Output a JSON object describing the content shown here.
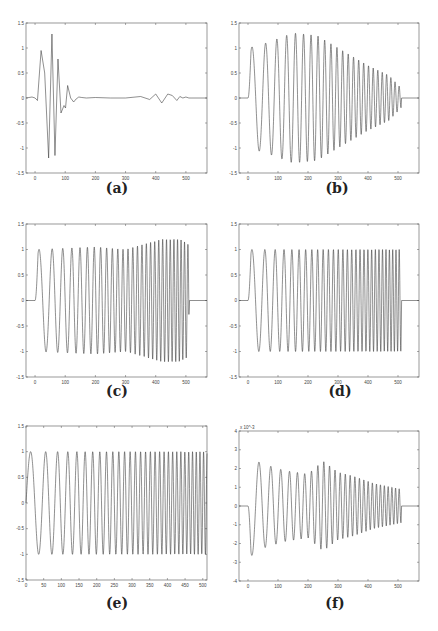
{
  "chart_data": [
    {
      "id": "a",
      "caption": "(a)",
      "type": "line",
      "box": {
        "left": 26,
        "top": 23,
        "right": 207,
        "bottom": 173
      },
      "xlim": [
        -30,
        570
      ],
      "ylim": [
        -1.5,
        1.5
      ],
      "xticks": [
        0,
        100,
        200,
        300,
        400,
        500
      ],
      "yticks": [
        -1.5,
        -1,
        -0.5,
        0,
        0.5,
        1,
        1.5
      ],
      "ytick_labels": [
        "-1.5",
        "-1",
        "-0.5",
        "0",
        "0.5",
        "1",
        "1.5"
      ],
      "x": [
        -30,
        -10,
        0,
        8,
        20,
        32,
        45,
        56,
        66,
        76,
        86,
        96,
        101,
        108,
        118,
        128,
        136,
        145,
        155,
        170,
        200,
        250,
        300,
        350,
        380,
        400,
        420,
        440,
        455,
        470,
        480,
        490,
        500,
        510,
        520,
        570
      ],
      "y": [
        0,
        0.02,
        0,
        -0.05,
        0.95,
        0.5,
        -1.2,
        1.28,
        -1.15,
        0.78,
        -0.3,
        -0.15,
        -0.2,
        0.25,
        0,
        -0.08,
        -0.02,
        0.02,
        0.01,
        0,
        0.01,
        0,
        0,
        0.03,
        -0.03,
        0.08,
        -0.1,
        0.08,
        0.05,
        -0.05,
        0.03,
        0,
        0.02,
        0,
        0,
        0
      ]
    },
    {
      "id": "b",
      "caption": "(b)",
      "type": "line",
      "box": {
        "left": 239,
        "top": 23,
        "right": 419,
        "bottom": 173
      },
      "xlim": [
        -30,
        570
      ],
      "ylim": [
        -1.5,
        1.5
      ],
      "xticks": [
        0,
        100,
        200,
        300,
        400,
        500
      ],
      "yticks": [
        -1.5,
        -1,
        -0.5,
        0,
        0.5,
        1,
        1.5
      ],
      "ytick_labels": [
        "-1.5",
        "-1",
        "-0.5",
        "0",
        "0.5",
        "1",
        "1.5"
      ],
      "signal": {
        "kind": "chirp",
        "start": 0,
        "end": 510,
        "f0": 0.018,
        "f1": 0.075,
        "amp_env": [
          [
            0,
            1.0
          ],
          [
            60,
            1.1
          ],
          [
            150,
            1.3
          ],
          [
            230,
            1.25
          ],
          [
            300,
            1.0
          ],
          [
            400,
            0.65
          ],
          [
            470,
            0.45
          ],
          [
            510,
            0.2
          ]
        ]
      }
    },
    {
      "id": "c",
      "caption": "(c)",
      "type": "line",
      "box": {
        "left": 26,
        "top": 224,
        "right": 207,
        "bottom": 377
      },
      "xlim": [
        -30,
        570
      ],
      "ylim": [
        -1.5,
        1.5
      ],
      "xticks": [
        0,
        100,
        200,
        300,
        400,
        500
      ],
      "yticks": [
        -1.5,
        -1,
        -0.5,
        0,
        0.5,
        1,
        1.5
      ],
      "ytick_labels": [
        "-1.5",
        "-1",
        "-0.5",
        "0",
        "0.5",
        "1",
        "1.5"
      ],
      "signal": {
        "kind": "chirp",
        "start": 0,
        "end": 510,
        "f0": 0.018,
        "f1": 0.09,
        "amp_env": [
          [
            0,
            1.0
          ],
          [
            200,
            1.05
          ],
          [
            300,
            1.0
          ],
          [
            420,
            1.2
          ],
          [
            480,
            1.2
          ],
          [
            510,
            1.1
          ]
        ]
      }
    },
    {
      "id": "d",
      "caption": "(d)",
      "type": "line",
      "box": {
        "left": 239,
        "top": 224,
        "right": 419,
        "bottom": 377
      },
      "xlim": [
        -30,
        570
      ],
      "ylim": [
        -1.5,
        1.5
      ],
      "xticks": [
        0,
        100,
        200,
        300,
        400,
        500
      ],
      "yticks": [
        -1.5,
        -1,
        -0.5,
        0,
        0.5,
        1,
        1.5
      ],
      "ytick_labels": [
        "-1.5",
        "-1",
        "-0.5",
        "0",
        "0.5",
        "1",
        "1.5"
      ],
      "signal": {
        "kind": "chirp",
        "start": 0,
        "end": 510,
        "f0": 0.018,
        "f1": 0.095,
        "amp_env": [
          [
            0,
            1.0
          ],
          [
            510,
            1.0
          ]
        ]
      }
    },
    {
      "id": "e",
      "caption": "(e)",
      "type": "line",
      "box": {
        "left": 26,
        "top": 426,
        "right": 207,
        "bottom": 580
      },
      "xlim": [
        0,
        512
      ],
      "ylim": [
        -1.5,
        1.5
      ],
      "xticks": [
        0,
        50,
        100,
        150,
        200,
        250,
        300,
        350,
        400,
        450,
        500
      ],
      "yticks": [
        -1.5,
        -1,
        -0.5,
        0,
        0.5,
        1,
        1.5
      ],
      "ytick_labels": [
        "-1.5",
        "-1",
        "-0.5",
        "0",
        "0.5",
        "1",
        "1.5"
      ],
      "signal": {
        "kind": "chirp",
        "start": 0,
        "end": 512,
        "f0": 0.018,
        "f1": 0.1,
        "amp_env": [
          [
            0,
            1.0
          ],
          [
            512,
            1.0
          ]
        ],
        "phase_start": "sin"
      }
    },
    {
      "id": "f",
      "caption": "(f)",
      "type": "line",
      "box": {
        "left": 239,
        "top": 431,
        "right": 419,
        "bottom": 581
      },
      "xlim": [
        -30,
        570
      ],
      "ylim": [
        -4,
        4
      ],
      "y_exponent": "x 10^-3",
      "xticks": [
        0,
        100,
        200,
        300,
        400,
        500
      ],
      "yticks": [
        -4,
        -3,
        -2,
        -1,
        0,
        1,
        2,
        3,
        4
      ],
      "ytick_labels": [
        "-4",
        "-3",
        "-2",
        "-1",
        "0",
        "1",
        "2",
        "3",
        "4"
      ],
      "signal": {
        "kind": "chirp_neg",
        "start": 0,
        "end": 510,
        "f0": 0.018,
        "f1": 0.085,
        "amp_env": [
          [
            0,
            2.8
          ],
          [
            40,
            2.3
          ],
          [
            120,
            1.9
          ],
          [
            200,
            1.7
          ],
          [
            250,
            2.4
          ],
          [
            300,
            1.8
          ],
          [
            350,
            1.6
          ],
          [
            420,
            1.2
          ],
          [
            510,
            0.9
          ]
        ]
      }
    }
  ]
}
